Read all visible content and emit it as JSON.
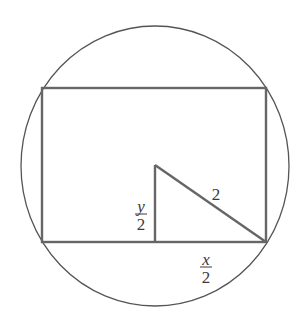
{
  "diagram": {
    "colors": {
      "background": "#ffffff",
      "circle_stroke": "#555555",
      "shape_stroke": "#666666",
      "text": "#3a3a3a"
    },
    "circle": {
      "cx": 155,
      "cy": 166,
      "rx": 134,
      "ry": 140
    },
    "rectangle": {
      "x": 42,
      "y": 88,
      "width": 224,
      "height": 154
    },
    "triangle": {
      "right_angle_vertex": {
        "x": 155,
        "y": 242
      },
      "top_vertex": {
        "x": 155,
        "y": 165
      },
      "corner_vertex": {
        "x": 266,
        "y": 242
      }
    },
    "labels": {
      "half_height": {
        "numerator": "y",
        "denominator": "2"
      },
      "radius": "2",
      "half_width": {
        "numerator": "x",
        "denominator": "2"
      }
    }
  }
}
